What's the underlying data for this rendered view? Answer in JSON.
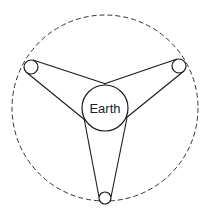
{
  "diagram": {
    "center_label": "Earth",
    "orbit": {
      "cx": 105,
      "cy": 108,
      "r": 93,
      "style": "dashed"
    },
    "earth": {
      "cx": 105,
      "cy": 108,
      "r": 23
    },
    "pulleys": [
      {
        "name": "left",
        "cx": 31,
        "cy": 67,
        "r": 7
      },
      {
        "name": "right",
        "cx": 179,
        "cy": 66,
        "r": 7
      },
      {
        "name": "bottom",
        "cx": 105,
        "cy": 198,
        "r": 6
      }
    ],
    "colors": {
      "stroke": "#1a1a1a",
      "background": "#ffffff"
    }
  }
}
